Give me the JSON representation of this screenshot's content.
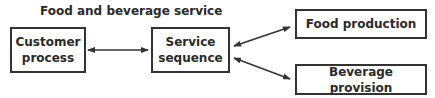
{
  "diagram": {
    "title": "Food and beverage service",
    "nodes": [
      {
        "id": "customer",
        "label_line1": "Customer",
        "label_line2": "process"
      },
      {
        "id": "service",
        "label_line1": "Service",
        "label_line2": "sequence"
      },
      {
        "id": "food",
        "label": "Food production"
      },
      {
        "id": "beverage",
        "label": "Beverage provision"
      }
    ],
    "edges": [
      {
        "from": "customer",
        "to": "service",
        "type": "bidirectional"
      },
      {
        "from": "service",
        "to": "food",
        "type": "bidirectional"
      },
      {
        "from": "service",
        "to": "beverage",
        "type": "bidirectional"
      }
    ]
  }
}
